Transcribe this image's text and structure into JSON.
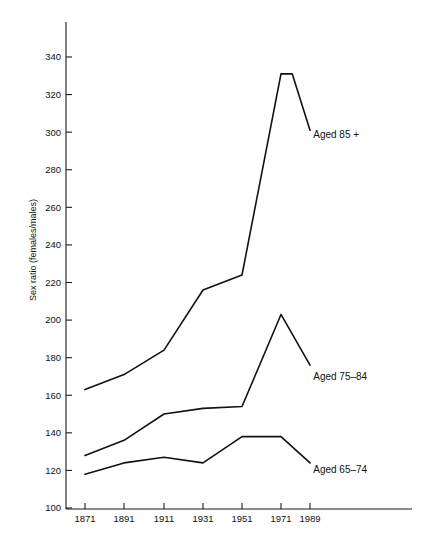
{
  "chart_data": {
    "type": "line",
    "title": "",
    "subtitle": "",
    "xlabel": "",
    "ylabel": "Sex ratio (females/males)",
    "categories": [
      "1871",
      "1891",
      "1911",
      "1931",
      "1951",
      "1971",
      "1989"
    ],
    "x": [
      1871,
      1891,
      1911,
      1931,
      1951,
      1971,
      1989
    ],
    "xlim": [
      1871,
      1989
    ],
    "ylim": [
      100,
      350
    ],
    "yticks": [
      100,
      120,
      140,
      160,
      180,
      200,
      220,
      240,
      260,
      280,
      300,
      320,
      340
    ],
    "ytick_labels": [
      "100",
      "120",
      "140",
      "160",
      "180",
      "200",
      "220",
      "240",
      "260",
      "280",
      "300",
      "320",
      "340"
    ],
    "xticks": [
      1871,
      1891,
      1911,
      1931,
      1951,
      1971,
      1989
    ],
    "xtick_labels": [
      "1871",
      "1891",
      "1911",
      "1931",
      "1951",
      "1971",
      "1989"
    ],
    "grid": false,
    "legend_position": "inline-annotations",
    "series": [
      {
        "name": "Aged 85 +",
        "label": "Aged 85 +",
        "color": "#111111",
        "values": [
          163,
          171,
          184,
          216,
          224,
          331,
          301
        ],
        "peak_x": 1978,
        "peak_value": 331,
        "label_x": 1991,
        "label_y": 299
      },
      {
        "name": "Aged 75-84",
        "label": "Aged 75–84",
        "color": "#111111",
        "values": [
          128,
          136,
          150,
          153,
          154,
          203,
          176
        ],
        "peak_x": 1971,
        "peak_value": 203,
        "label_x": 1991,
        "label_y": 170
      },
      {
        "name": "Aged 65-74",
        "label": "Aged 65–74",
        "color": "#111111",
        "values": [
          118,
          124,
          127,
          124,
          138,
          138,
          124
        ],
        "peak_x": 1961,
        "peak_value": 138,
        "label_x": 1991,
        "label_y": 121
      }
    ]
  },
  "axis": {
    "y_title": "Sex ratio (females/males)",
    "x_title": ""
  }
}
